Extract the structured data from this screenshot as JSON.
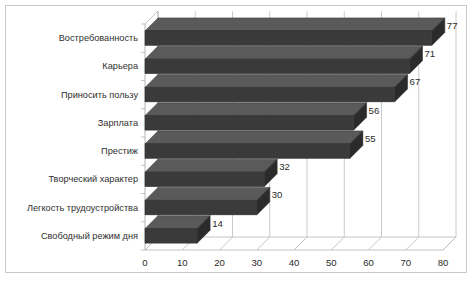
{
  "chart_data": {
    "type": "bar",
    "orientation": "horizontal",
    "style": "3d",
    "title": "",
    "xlabel": "",
    "ylabel": "",
    "xlim": [
      0,
      80
    ],
    "xticks": [
      "0",
      "10",
      "20",
      "30",
      "40",
      "50",
      "60",
      "70",
      "80"
    ],
    "grid": true,
    "legend": false,
    "categories": [
      "Востребованность",
      "Карьера",
      "Приносить пользу",
      "Зарплата",
      "Престиж",
      "Творческий характер",
      "Легкость трудоустройства",
      "Свободный режим дня"
    ],
    "values": [
      77,
      71,
      67,
      56,
      55,
      32,
      30,
      14
    ],
    "value_labels": [
      "77",
      "71",
      "67",
      "56",
      "55",
      "32",
      "30",
      "14"
    ],
    "colors": {
      "bar_face": "#3a3a3a",
      "bar_top": "#5a5a5a",
      "bar_side": "#2b2b2b",
      "axis": "#b5b5b5",
      "gridline": "#bcbcbc",
      "frame": "#c8c8c8",
      "text": "#2b2b2b",
      "background": "#ffffff"
    }
  }
}
